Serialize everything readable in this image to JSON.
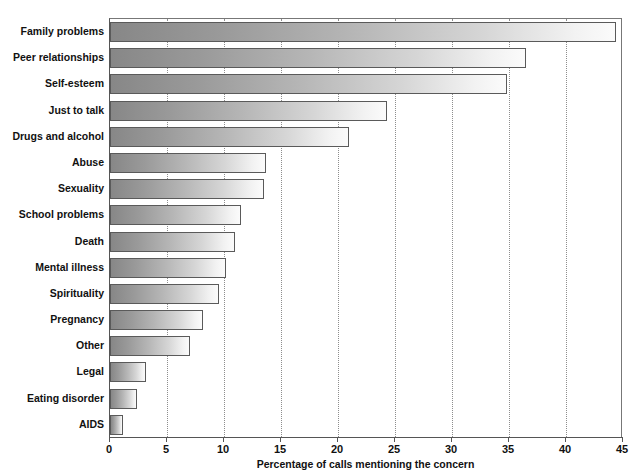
{
  "chart_data": {
    "type": "bar",
    "orientation": "horizontal",
    "title": "",
    "xlabel": "Percentage of calls mentioning the concern",
    "ylabel": "",
    "xlim": [
      0,
      45
    ],
    "ylim": null,
    "xticks": [
      0,
      5,
      10,
      15,
      20,
      25,
      30,
      35,
      40,
      45
    ],
    "xtick_labels": [
      "0",
      "5",
      "10",
      "15",
      "20",
      "25",
      "30",
      "35",
      "40",
      "45"
    ],
    "grid": "vertical-dotted",
    "legend": null,
    "categories": [
      "Family problems",
      "Peer relationships",
      "Self-esteem",
      "Just to talk",
      "Drugs and alcohol",
      "Abuse",
      "Sexuality",
      "School problems",
      "Death",
      "Mental illness",
      "Spirituality",
      "Pregnancy",
      "Other",
      "Legal",
      "Eating disorder",
      "AIDS"
    ],
    "values": [
      44.4,
      36.5,
      34.8,
      24.3,
      21.0,
      13.7,
      13.5,
      11.5,
      11.0,
      10.2,
      9.6,
      8.2,
      7.0,
      3.2,
      2.4,
      1.1
    ],
    "bar_style": {
      "gradient_start": "#878787",
      "gradient_end": "#fbfbfb",
      "border": "#5a5a5a"
    },
    "gridline_color": "#8d8d8d",
    "axis_color": "#555555"
  }
}
